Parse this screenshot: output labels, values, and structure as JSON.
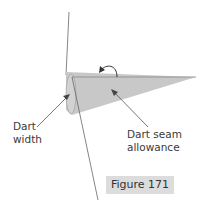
{
  "figure": {
    "caption": "Figure 171",
    "labels": {
      "dart_width_line1": "Dart",
      "dart_width_line2": "width",
      "seam_line1": "Dart seam",
      "seam_line2": "allowance"
    },
    "colors": {
      "dart_fill": "#c8c8c8",
      "line": "#555555",
      "caption_bg": "#dcdcdc"
    }
  }
}
